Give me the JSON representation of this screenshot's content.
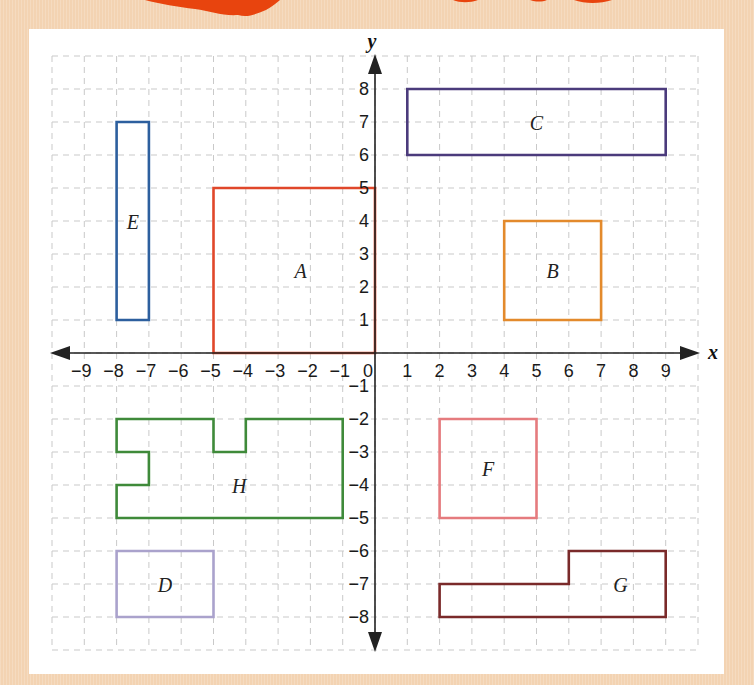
{
  "colors": {
    "background": "#f3d3b2",
    "panel": "#ffffff",
    "grid": "#c9c9c9",
    "axis": "#222222",
    "decoration": "#e8440e"
  },
  "axes": {
    "x_label": "x",
    "y_label": "y",
    "x_range": [
      -10,
      10
    ],
    "y_range": [
      -9,
      9
    ],
    "x_ticks": [
      -9,
      -8,
      -7,
      -6,
      -5,
      -4,
      -3,
      -2,
      -1,
      0,
      1,
      2,
      3,
      4,
      5,
      6,
      7,
      8,
      9
    ],
    "y_ticks": [
      8,
      7,
      6,
      5,
      4,
      3,
      2,
      1,
      -1,
      -2,
      -3,
      -4,
      -5,
      -6,
      -7,
      -8
    ]
  },
  "shapes": [
    {
      "label": "A",
      "color": "#e0472a",
      "points": [
        [
          -5,
          5
        ],
        [
          0,
          5
        ],
        [
          0,
          0
        ],
        [
          -5,
          0
        ]
      ],
      "label_pos": [
        -2.3,
        2.4
      ]
    },
    {
      "label": "B",
      "color": "#e38a2c",
      "points": [
        [
          4,
          4
        ],
        [
          7,
          4
        ],
        [
          7,
          1
        ],
        [
          4,
          1
        ]
      ],
      "label_pos": [
        5.5,
        2.4
      ]
    },
    {
      "label": "C",
      "color": "#4b3b7c",
      "points": [
        [
          1,
          8
        ],
        [
          9,
          8
        ],
        [
          9,
          6
        ],
        [
          1,
          6
        ]
      ],
      "label_pos": [
        5,
        6.9
      ]
    },
    {
      "label": "D",
      "color": "#aaa2cc",
      "points": [
        [
          -8,
          -6
        ],
        [
          -5,
          -6
        ],
        [
          -5,
          -8
        ],
        [
          -8,
          -8
        ]
      ],
      "label_pos": [
        -6.5,
        -7.1
      ]
    },
    {
      "label": "E",
      "color": "#2d5f9e",
      "points": [
        [
          -8,
          7
        ],
        [
          -7,
          7
        ],
        [
          -7,
          1
        ],
        [
          -8,
          1
        ]
      ],
      "label_pos": [
        -7.5,
        3.9
      ]
    },
    {
      "label": "F",
      "color": "#e57b7e",
      "points": [
        [
          2,
          -2
        ],
        [
          5,
          -2
        ],
        [
          5,
          -5
        ],
        [
          2,
          -5
        ]
      ],
      "label_pos": [
        3.5,
        -3.6
      ]
    },
    {
      "label": "G",
      "color": "#7a2a2a",
      "points": [
        [
          2,
          -7
        ],
        [
          6,
          -7
        ],
        [
          6,
          -6
        ],
        [
          9,
          -6
        ],
        [
          9,
          -8
        ],
        [
          2,
          -8
        ]
      ],
      "label_pos": [
        7.6,
        -7.1
      ]
    },
    {
      "label": "H",
      "color": "#3f8a3a",
      "points": [
        [
          -8,
          -2
        ],
        [
          -5,
          -2
        ],
        [
          -5,
          -3
        ],
        [
          -4,
          -3
        ],
        [
          -4,
          -2
        ],
        [
          -1,
          -2
        ],
        [
          -1,
          -5
        ],
        [
          -8,
          -5
        ],
        [
          -8,
          -4
        ],
        [
          -7,
          -4
        ],
        [
          -7,
          -3
        ],
        [
          -8,
          -3
        ]
      ],
      "label_pos": [
        -4.2,
        -4.1
      ]
    }
  ]
}
